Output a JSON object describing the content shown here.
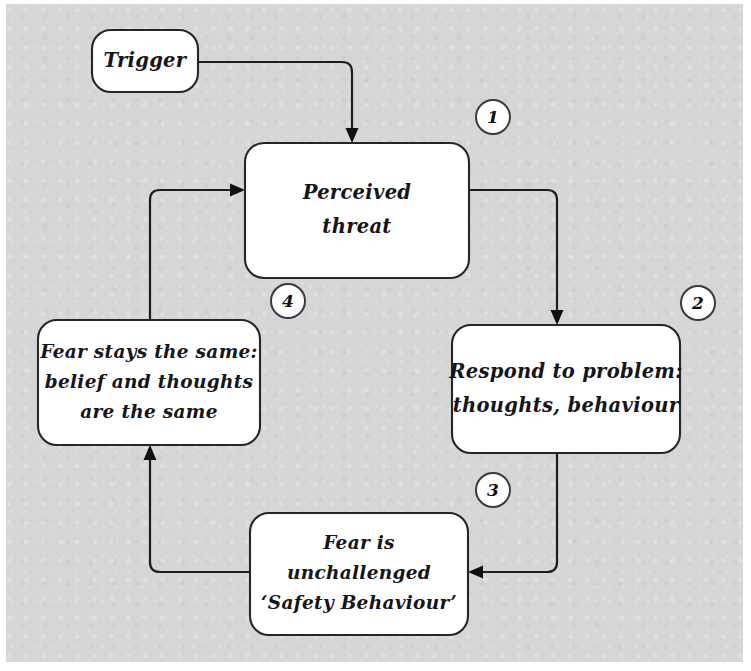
{
  "diagram": {
    "background_color": "#d6d6d6",
    "ink_color": "#1d1d20",
    "node_fill": "#ffffff",
    "nodes": [
      {
        "id": "trigger",
        "lines": [
          "Trigger"
        ],
        "x": 92,
        "y": 30,
        "w": 106,
        "h": 62
      },
      {
        "id": "perceived-threat",
        "lines": [
          "Perceived",
          "threat"
        ],
        "x": 245,
        "y": 143,
        "w": 224,
        "h": 135
      },
      {
        "id": "respond-to-problem",
        "lines": [
          "Respond to problem:",
          "thoughts, behaviour"
        ],
        "x": 452,
        "y": 325,
        "w": 228,
        "h": 128
      },
      {
        "id": "fear-unchallenged",
        "lines": [
          "Fear is",
          "unchallenged",
          "‘Safety Behaviour’"
        ],
        "x": 250,
        "y": 513,
        "w": 218,
        "h": 122
      },
      {
        "id": "fear-stays-same",
        "lines": [
          "Fear stays the same:",
          "belief and thoughts",
          "are the same"
        ],
        "x": 38,
        "y": 320,
        "w": 222,
        "h": 125
      }
    ],
    "step_markers": [
      {
        "id": "step-1",
        "label": "1",
        "cx": 493,
        "cy": 117,
        "r": 17
      },
      {
        "id": "step-2",
        "label": "2",
        "cx": 698,
        "cy": 303,
        "r": 17
      },
      {
        "id": "step-3",
        "label": "3",
        "cx": 493,
        "cy": 490,
        "r": 17
      },
      {
        "id": "step-4",
        "label": "4",
        "cx": 288,
        "cy": 301,
        "r": 17
      }
    ],
    "connectors": [
      {
        "id": "trigger-to-perceived-threat",
        "from": "trigger",
        "to": "perceived-threat",
        "path": "M 198 62 L 342 62 Q 352 62 352 72 L 352 132",
        "arrow": "M 352 143 L 345.5 128 L 358.5 128 Z"
      },
      {
        "id": "perceived-threat-to-respond",
        "from": "perceived-threat",
        "to": "respond-to-problem",
        "path": "M 469 190 L 547 190 Q 557 190 557 200 L 557 314",
        "arrow": "M 557 325 L 550.5 310 L 563.5 310 Z"
      },
      {
        "id": "respond-to-fear-unchallenged",
        "from": "respond-to-problem",
        "to": "fear-unchallenged",
        "path": "M 557 453 L 557 562 Q 557 572 547 572 L 479 572",
        "arrow": "M 468 572 L 483 565.5 L 483 578.5 Z"
      },
      {
        "id": "fear-unchallenged-to-fear-stays",
        "from": "fear-unchallenged",
        "to": "fear-stays-same",
        "path": "M 250 572 L 160 572 Q 150 572 150 562 L 150 456",
        "arrow": "M 150 445 L 143.5 460 L 156.5 460 Z"
      },
      {
        "id": "fear-stays-to-perceived-threat",
        "from": "fear-stays-same",
        "to": "perceived-threat",
        "path": "M 150 320 L 150 200 Q 150 190 160 190 L 234 190",
        "arrow": "M 245 190 L 230 183.5 L 230 196.5 Z"
      }
    ]
  }
}
